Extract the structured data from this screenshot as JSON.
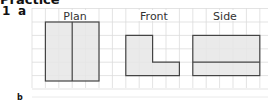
{
  "heading": "Practice",
  "question": {
    "number": "1",
    "part": "a",
    "next_part": "b"
  },
  "views": [
    {
      "name": "plan",
      "label": "Plan"
    },
    {
      "name": "front",
      "label": "Front"
    },
    {
      "name": "side",
      "label": "Side"
    }
  ],
  "colors": {
    "grid": "#d9d9d9",
    "fill": "#e6e6e6",
    "outline": "#444444"
  }
}
